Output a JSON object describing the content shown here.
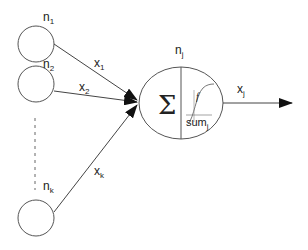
{
  "diagram": {
    "type": "perceptron-neuron",
    "input_nodes": [
      {
        "id": "n1",
        "label": "n",
        "subscript": "1",
        "edge_label": "x",
        "edge_subscript": "1"
      },
      {
        "id": "n2",
        "label": "n",
        "subscript": "2",
        "edge_label": "x",
        "edge_subscript": "2"
      },
      {
        "id": "nk",
        "label": "n",
        "subscript": "k",
        "edge_label": "x",
        "edge_subscript": "k"
      }
    ],
    "neuron": {
      "label": "n",
      "subscript": "j",
      "sum_symbol": "Σ",
      "activation_label": "f",
      "sum_text": "sum",
      "sum_subscript": "j"
    },
    "output": {
      "label": "x",
      "subscript": "j"
    },
    "colors": {
      "stroke": "#444444",
      "text": "#222222",
      "background": "#ffffff"
    }
  }
}
